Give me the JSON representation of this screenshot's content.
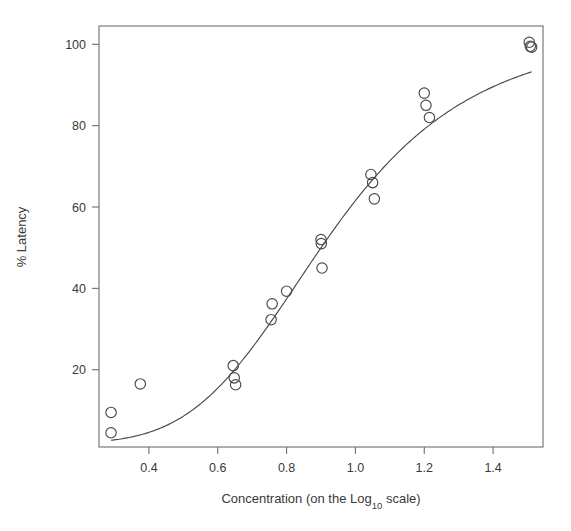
{
  "chart_data": {
    "type": "scatter",
    "title": "",
    "xlabel": "Concentration (on the Log10 scale)",
    "xlabel_main": "Concentration (on the Log",
    "xlabel_sub": "10",
    "xlabel_tail": " scale)",
    "ylabel": "% Latency",
    "xlim": [
      0.255,
      1.545
    ],
    "ylim": [
      1.0,
      104.5
    ],
    "grid": false,
    "legend": false,
    "xticks": [
      0.4,
      0.6,
      0.8,
      1.0,
      1.2,
      1.4
    ],
    "xtick_labels": [
      "0.4",
      "0.6",
      "0.8",
      "1.0",
      "1.2",
      "1.4"
    ],
    "yticks": [
      20,
      40,
      60,
      80,
      100
    ],
    "ytick_labels": [
      "20",
      "40",
      "60",
      "80",
      "100"
    ],
    "marker": "open-circle",
    "marker_size": 5.2,
    "point_color": "#4a4a4a",
    "curve_color": "#4a4a4a",
    "x": [
      0.29,
      0.29,
      0.375,
      0.645,
      0.648,
      0.652,
      0.755,
      0.758,
      0.8,
      0.9,
      0.901,
      0.903,
      1.045,
      1.05,
      1.055,
      1.2,
      1.205,
      1.215,
      1.505,
      1.508,
      1.512
    ],
    "y": [
      9.5,
      4.5,
      16.5,
      21.0,
      18.0,
      16.3,
      32.3,
      36.2,
      39.3,
      52.0,
      51.0,
      45.0,
      68.0,
      66.0,
      62.0,
      88.0,
      85.0,
      82.0,
      100.5,
      99.5,
      99.3
    ],
    "series": [
      {
        "name": "observations",
        "points": [
          {
            "x": 0.29,
            "y": 9.5
          },
          {
            "x": 0.29,
            "y": 4.5
          },
          {
            "x": 0.375,
            "y": 16.5
          },
          {
            "x": 0.645,
            "y": 21.0
          },
          {
            "x": 0.648,
            "y": 18.0
          },
          {
            "x": 0.652,
            "y": 16.3
          },
          {
            "x": 0.755,
            "y": 32.3
          },
          {
            "x": 0.758,
            "y": 36.2
          },
          {
            "x": 0.8,
            "y": 39.3
          },
          {
            "x": 0.9,
            "y": 52.0
          },
          {
            "x": 0.901,
            "y": 51.0
          },
          {
            "x": 0.903,
            "y": 45.0
          },
          {
            "x": 1.045,
            "y": 68.0
          },
          {
            "x": 1.05,
            "y": 66.0
          },
          {
            "x": 1.055,
            "y": 62.0
          },
          {
            "x": 1.2,
            "y": 88.0
          },
          {
            "x": 1.205,
            "y": 85.0
          },
          {
            "x": 1.215,
            "y": 82.0
          },
          {
            "x": 1.505,
            "y": 100.5
          },
          {
            "x": 1.508,
            "y": 99.5
          },
          {
            "x": 1.512,
            "y": 99.3
          }
        ]
      },
      {
        "name": "fitted-logistic-curve",
        "type": "line",
        "model": "4-parameter logistic",
        "params": {
          "lower": 2.0,
          "upper": 104.0,
          "ec50": 0.925,
          "hill": 4.35
        },
        "x_range": [
          0.29,
          1.512
        ]
      }
    ]
  },
  "geometry": {
    "plot_left": 99,
    "plot_right": 543,
    "plot_top": 26,
    "plot_bottom": 447
  }
}
